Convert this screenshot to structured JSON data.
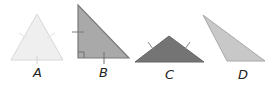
{
  "figure": {
    "triangles": [
      {
        "label": "A",
        "type": "equilateral",
        "fill": "#efefef",
        "stroke": "#d8d8d8",
        "points": "37,14 11,60 63,60",
        "label_pos": {
          "x": 33,
          "y": 66
        }
      },
      {
        "label": "B",
        "type": "right",
        "fill": "#a9a9a9",
        "stroke": "#7a7a7a",
        "points": "78,5 78,58 129,58",
        "label_pos": {
          "x": 98,
          "y": 66
        }
      },
      {
        "label": "C",
        "type": "obtuse isosceles",
        "fill": "#747474",
        "stroke": "#666666",
        "points": "169,36 135,62 204,62",
        "label_pos": {
          "x": 165,
          "y": 69
        }
      },
      {
        "label": "D",
        "type": "obtuse scalene",
        "fill": "#c8c8c8",
        "stroke": "#a8a8a8",
        "points": "203,15 227,61 265,61",
        "label_pos": {
          "x": 237,
          "y": 69
        }
      }
    ]
  }
}
